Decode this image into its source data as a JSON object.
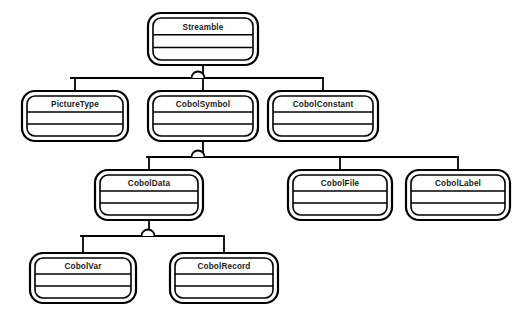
{
  "diagram": {
    "notation": "booch-omt-generalization",
    "background_color": "#ffffff",
    "line_color": "#000000",
    "text_color": "#1a1a1a",
    "canvas": {
      "width": 520,
      "height": 328
    },
    "classes": [
      {
        "id": "streamble",
        "name": "Streamble",
        "x": 148,
        "y": 13,
        "w": 110,
        "h": 52,
        "compartments": 3
      },
      {
        "id": "picturetype",
        "name": "PictureType",
        "x": 22,
        "y": 91,
        "w": 106,
        "h": 50,
        "compartments": 3
      },
      {
        "id": "cobolsymbol",
        "name": "CobolSymbol",
        "x": 148,
        "y": 91,
        "w": 110,
        "h": 50,
        "compartments": 3
      },
      {
        "id": "cobolconstant",
        "name": "CobolConstant",
        "x": 268,
        "y": 91,
        "w": 110,
        "h": 50,
        "compartments": 3
      },
      {
        "id": "coboldata",
        "name": "CobolData",
        "x": 95,
        "y": 170,
        "w": 108,
        "h": 50,
        "compartments": 3
      },
      {
        "id": "cobolfile",
        "name": "CobolFile",
        "x": 288,
        "y": 170,
        "w": 104,
        "h": 50,
        "compartments": 3
      },
      {
        "id": "cobollabel",
        "name": "CobolLabel",
        "x": 406,
        "y": 170,
        "w": 104,
        "h": 50,
        "compartments": 3
      },
      {
        "id": "cobolvar",
        "name": "CobolVar",
        "x": 30,
        "y": 253,
        "w": 106,
        "h": 50,
        "compartments": 3
      },
      {
        "id": "cobolrecord",
        "name": "CobolRecord",
        "x": 170,
        "y": 253,
        "w": 108,
        "h": 50,
        "compartments": 3
      }
    ],
    "generalizations": [
      {
        "id": "gen-streamble",
        "parent": "Streamble",
        "children": [
          "PictureType",
          "CobolSymbol",
          "CobolConstant"
        ],
        "marker_x": 198,
        "marker_y": 78,
        "bus_y": 78,
        "bus_x1": 71,
        "bus_x2": 322
      },
      {
        "id": "gen-cobolsymbol",
        "parent": "CobolSymbol",
        "children": [
          "CobolData",
          "CobolFile",
          "CobolLabel"
        ],
        "marker_x": 198,
        "marker_y": 157,
        "bus_y": 157,
        "bus_x1": 147,
        "bus_x2": 456
      },
      {
        "id": "gen-coboldata",
        "parent": "CobolData",
        "children": [
          "CobolVar",
          "CobolRecord"
        ],
        "marker_x": 148,
        "marker_y": 236,
        "bus_y": 236,
        "bus_x1": 81,
        "bus_x2": 222
      }
    ]
  }
}
